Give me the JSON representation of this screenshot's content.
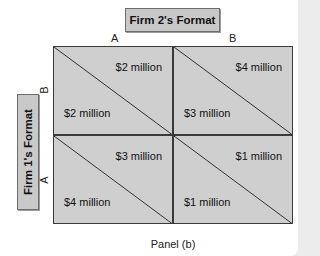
{
  "diagram": {
    "type": "payoff_matrix",
    "column_player": {
      "label": "Firm 2's Format",
      "options": [
        "A",
        "B"
      ]
    },
    "row_player": {
      "label": "Firm 1's Format",
      "options": [
        "B",
        "A"
      ]
    },
    "cells": [
      {
        "row": "B",
        "col": "A",
        "firm2_payoff": "$2 million",
        "firm1_payoff": "$2 million"
      },
      {
        "row": "B",
        "col": "B",
        "firm2_payoff": "$4 million",
        "firm1_payoff": "$3 million"
      },
      {
        "row": "A",
        "col": "A",
        "firm2_payoff": "$3 million",
        "firm1_payoff": "$4 million"
      },
      {
        "row": "A",
        "col": "B",
        "firm2_payoff": "$1 million",
        "firm1_payoff": "$1 million"
      }
    ],
    "caption": "Panel (b)"
  }
}
